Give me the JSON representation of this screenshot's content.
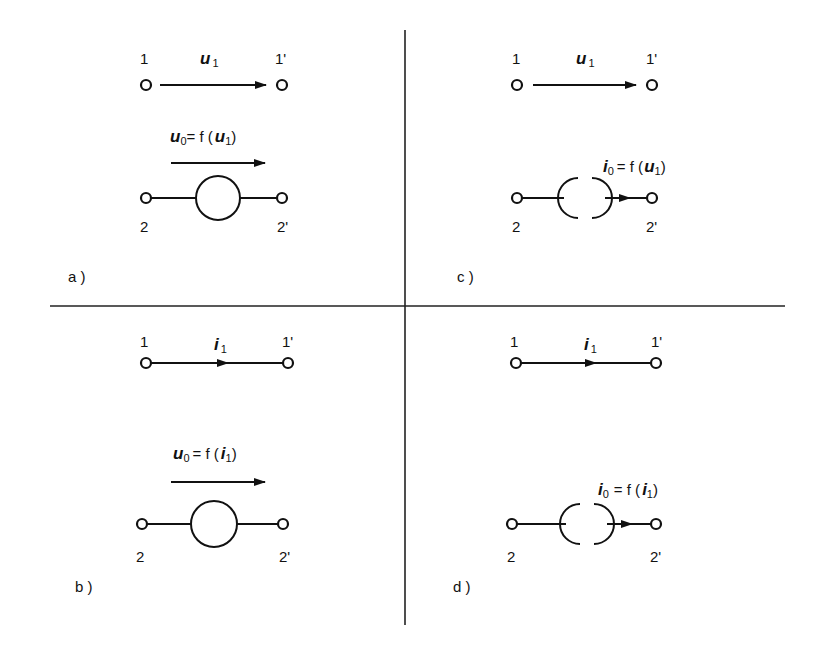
{
  "figure": {
    "dividers": {
      "vertical_x": 405,
      "horizontal_y": 306
    },
    "panels": [
      {
        "id": "a",
        "label": "a )",
        "input": {
          "terminal_left": "1",
          "terminal_right": "1'",
          "quantity": "u",
          "quantity_sub": "1",
          "kind": "voltage"
        },
        "output": {
          "terminal_left": "2",
          "terminal_right": "2'",
          "equation_lhs": "u",
          "equation_lhs_sub": "0",
          "equation_rhs": "= f (",
          "equation_arg": "u",
          "equation_arg_sub": "1",
          "equation_close": ")",
          "source_type": "voltage-source"
        }
      },
      {
        "id": "b",
        "label": "b )",
        "input": {
          "terminal_left": "1",
          "terminal_right": "1'",
          "quantity": "i",
          "quantity_sub": "1",
          "kind": "current"
        },
        "output": {
          "terminal_left": "2",
          "terminal_right": "2'",
          "equation_lhs": "u",
          "equation_lhs_sub": "0",
          "equation_rhs": "=  f (",
          "equation_arg": "i",
          "equation_arg_sub": "1",
          "equation_close": ")",
          "source_type": "voltage-source"
        }
      },
      {
        "id": "c",
        "label": "c )",
        "input": {
          "terminal_left": "1",
          "terminal_right": "1'",
          "quantity": "u",
          "quantity_sub": "1",
          "kind": "voltage"
        },
        "output": {
          "terminal_left": "2",
          "terminal_right": "2'",
          "equation_lhs": "i",
          "equation_lhs_sub": "0",
          "equation_rhs": "= f (",
          "equation_arg": "u",
          "equation_arg_sub": "1",
          "equation_close": ")",
          "source_type": "current-source"
        }
      },
      {
        "id": "d",
        "label": "d )",
        "input": {
          "terminal_left": "1",
          "terminal_right": "1'",
          "quantity": "i",
          "quantity_sub": "1",
          "kind": "current"
        },
        "output": {
          "terminal_left": "2",
          "terminal_right": "2'",
          "equation_lhs": "i",
          "equation_lhs_sub": "0",
          "equation_rhs": "= f (",
          "equation_arg": "i",
          "equation_arg_sub": "1",
          "equation_close": ")",
          "source_type": "current-source"
        }
      }
    ]
  }
}
